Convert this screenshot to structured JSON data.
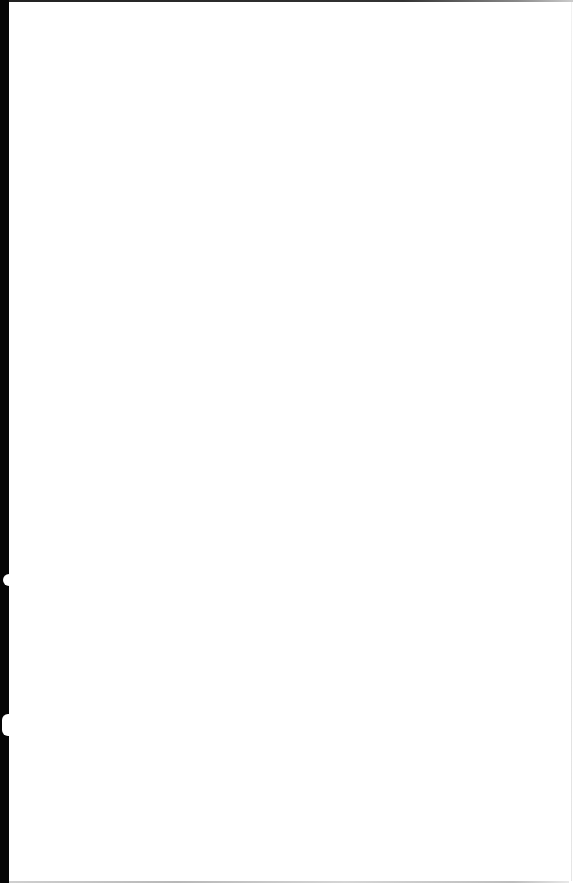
{
  "page": {
    "type": "blank-scanned-page",
    "text": "",
    "colors": {
      "paper": "#ffffff",
      "scanner_edge": "#050505"
    }
  }
}
